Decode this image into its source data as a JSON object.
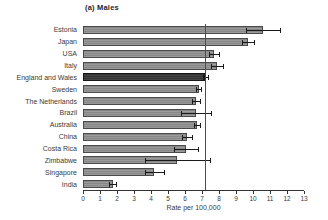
{
  "header": {
    "title": "(a) Males"
  },
  "chart_data": {
    "type": "bar",
    "orientation": "horizontal",
    "title": "(a) Males",
    "xlabel": "Rate per 100,000",
    "ylabel": "",
    "xlim": [
      0,
      13
    ],
    "xticks": [
      0,
      1,
      2,
      3,
      4,
      5,
      6,
      7,
      8,
      9,
      10,
      11,
      12,
      13
    ],
    "grid": false,
    "legend": "none",
    "categories": [
      "Estonia",
      "Japan",
      "USA",
      "Italy",
      "England and Wales",
      "Sweden",
      "The Netherlands",
      "Brazil",
      "Australia",
      "China",
      "Costa Rica",
      "Zimbabwe",
      "Singapore",
      "India"
    ],
    "values": [
      10.6,
      9.7,
      7.7,
      7.9,
      7.2,
      6.8,
      6.65,
      6.65,
      6.7,
      6.1,
      6.05,
      5.55,
      4.2,
      1.75
    ],
    "errors": [
      1.0,
      0.35,
      0.3,
      0.35,
      0.15,
      0.15,
      0.25,
      0.9,
      0.2,
      0.3,
      0.7,
      1.9,
      0.55,
      0.2
    ],
    "error_bars": true,
    "reference_line_x": 7.2,
    "highlight_category": "England and Wales"
  },
  "colors": {
    "background": "#ffffff",
    "bar_fill": "#8f8f8f",
    "bar_border": "#4a4a4a",
    "highlight_fill": "#3d3d3d",
    "highlight_border": "#161616",
    "error_bar": "#1a1a1a",
    "axis": "#333333",
    "reference_line": "#4d4d4d",
    "text": "#2b2b2b"
  }
}
